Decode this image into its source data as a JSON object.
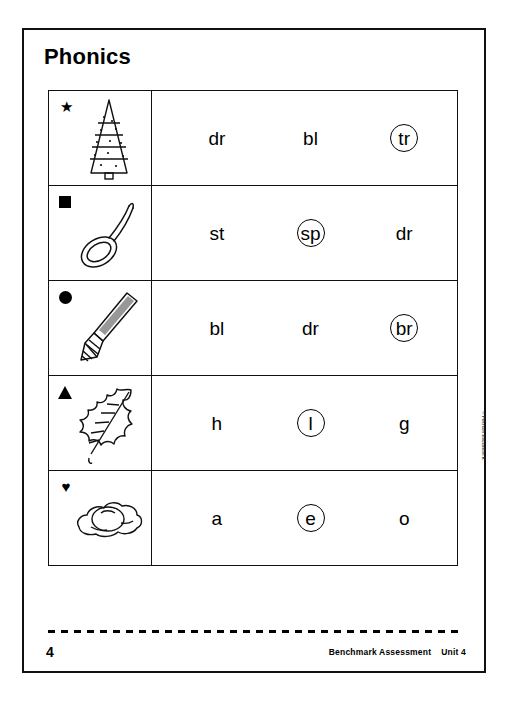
{
  "page": {
    "title": "Phonics",
    "page_number": "4",
    "copyright": "© Pearson Education K"
  },
  "footer": {
    "assessment_label": "Benchmark Assessment",
    "unit_label": "Unit 4"
  },
  "table": {
    "rows": [
      {
        "marker": "star",
        "marker_glyph": "★",
        "picture": "christmas-tree",
        "picture_alt": "tree",
        "options": [
          {
            "label": "dr",
            "circled": false
          },
          {
            "label": "bl",
            "circled": false
          },
          {
            "label": "tr",
            "circled": true
          }
        ]
      },
      {
        "marker": "square",
        "marker_glyph": "■",
        "picture": "spoon",
        "picture_alt": "spoon",
        "options": [
          {
            "label": "st",
            "circled": false
          },
          {
            "label": "sp",
            "circled": true
          },
          {
            "label": "dr",
            "circled": false
          }
        ]
      },
      {
        "marker": "circle",
        "marker_glyph": "●",
        "picture": "paintbrush",
        "picture_alt": "brush",
        "options": [
          {
            "label": "bl",
            "circled": false
          },
          {
            "label": "dr",
            "circled": false
          },
          {
            "label": "br",
            "circled": true
          }
        ]
      },
      {
        "marker": "triangle",
        "marker_glyph": "▲",
        "picture": "leaf",
        "picture_alt": "leaf",
        "options": [
          {
            "label": "h",
            "circled": false
          },
          {
            "label": "l",
            "circled": true
          },
          {
            "label": "g",
            "circled": false
          }
        ]
      },
      {
        "marker": "heart",
        "marker_glyph": "♥",
        "picture": "fried-egg",
        "picture_alt": "egg",
        "options": [
          {
            "label": "a",
            "circled": false
          },
          {
            "label": "e",
            "circled": true
          },
          {
            "label": "o",
            "circled": false
          }
        ]
      }
    ]
  },
  "colors": {
    "ink": "#000000",
    "paper": "#ffffff"
  }
}
